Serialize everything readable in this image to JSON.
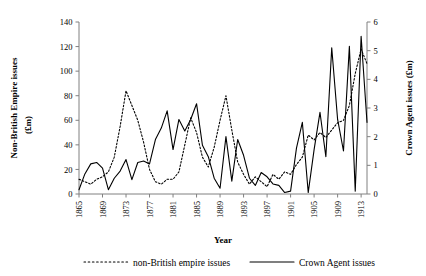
{
  "chart_data": {
    "type": "line",
    "title": "",
    "xlabel": "Year",
    "ylabel": "Non-British Empire issues (£m)",
    "y2label": "Crown Agent issues (£m)",
    "grid": false,
    "legend_position": "bottom",
    "xlim": [
      1865,
      1914
    ],
    "ylim": [
      0,
      140
    ],
    "y2lim": [
      0,
      6
    ],
    "yticks": [
      0,
      20,
      40,
      60,
      80,
      100,
      120,
      140
    ],
    "y2ticks": [
      0,
      1,
      2,
      3,
      4,
      5,
      6
    ],
    "xticks": [
      1865,
      1869,
      1873,
      1877,
      1881,
      1885,
      1889,
      1893,
      1897,
      1901,
      1905,
      1909,
      1913
    ],
    "x": [
      1865,
      1866,
      1867,
      1868,
      1869,
      1870,
      1871,
      1872,
      1873,
      1874,
      1875,
      1876,
      1877,
      1878,
      1879,
      1880,
      1881,
      1882,
      1883,
      1884,
      1885,
      1886,
      1887,
      1888,
      1889,
      1890,
      1891,
      1892,
      1893,
      1894,
      1895,
      1896,
      1897,
      1898,
      1899,
      1900,
      1901,
      1902,
      1903,
      1904,
      1905,
      1906,
      1907,
      1908,
      1909,
      1910,
      1911,
      1912,
      1913,
      1914
    ],
    "series": [
      {
        "name": "non-British empire issues",
        "axis": "left",
        "style": "dotted",
        "color": "#000000",
        "unit": "£m",
        "values": [
          12,
          10,
          8,
          12,
          14,
          18,
          30,
          55,
          84,
          72,
          60,
          42,
          20,
          10,
          8,
          12,
          12,
          18,
          40,
          62,
          50,
          30,
          22,
          38,
          60,
          80,
          52,
          26,
          16,
          8,
          14,
          10,
          6,
          16,
          12,
          18,
          16,
          24,
          30,
          48,
          44,
          50,
          46,
          52,
          58,
          60,
          72,
          98,
          118,
          106
        ]
      },
      {
        "name": "Crown Agent issues",
        "axis": "right",
        "style": "solid",
        "color": "#000000",
        "unit": "£m",
        "values": [
          0.15,
          0.7,
          1.05,
          1.1,
          0.9,
          0.15,
          0.55,
          0.8,
          1.2,
          0.5,
          1.1,
          1.15,
          1.05,
          1.9,
          2.3,
          2.9,
          1.55,
          2.6,
          2.2,
          2.6,
          3.15,
          1.7,
          1.3,
          0.55,
          0.2,
          2.0,
          0.45,
          1.9,
          1.35,
          0.55,
          0.3,
          0.75,
          0.6,
          0.35,
          0.3,
          0.05,
          0.1,
          1.6,
          2.5,
          0.05,
          1.55,
          2.85,
          1.3,
          5.1,
          2.6,
          1.5,
          5.15,
          0.1,
          5.5,
          2.5
        ]
      }
    ]
  },
  "legend": {
    "items": [
      {
        "label": "non-British empire issues",
        "style": "dotted"
      },
      {
        "label": "Crown Agent issues",
        "style": "solid"
      }
    ]
  }
}
